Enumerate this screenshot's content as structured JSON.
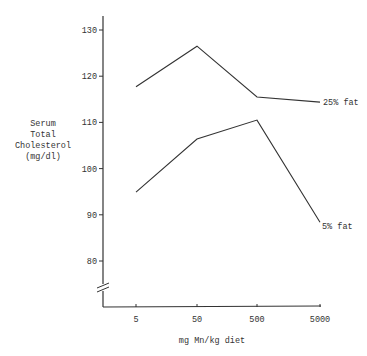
{
  "chart_data": {
    "type": "line",
    "title": "",
    "xlabel": "mg Mn/kg diet",
    "ylabel_lines": [
      "Serum",
      "Total",
      "Cholesterol",
      "(mg/dl)"
    ],
    "ylabel": "Serum Total Cholesterol (mg/dl)",
    "categories": [
      "5",
      "50",
      "500",
      "5000"
    ],
    "x_scale": "log",
    "y_ticks": [
      80,
      90,
      100,
      110,
      120,
      130
    ],
    "ylim": [
      75,
      133
    ],
    "y_axis_break": true,
    "grid": false,
    "legend": "inline labels at line ends",
    "series": [
      {
        "name": "25% fat",
        "values": [
          117.7,
          126.5,
          115.5,
          114.4
        ]
      },
      {
        "name": "5% fat",
        "values": [
          94.9,
          106.4,
          110.5,
          88.4
        ]
      }
    ]
  }
}
